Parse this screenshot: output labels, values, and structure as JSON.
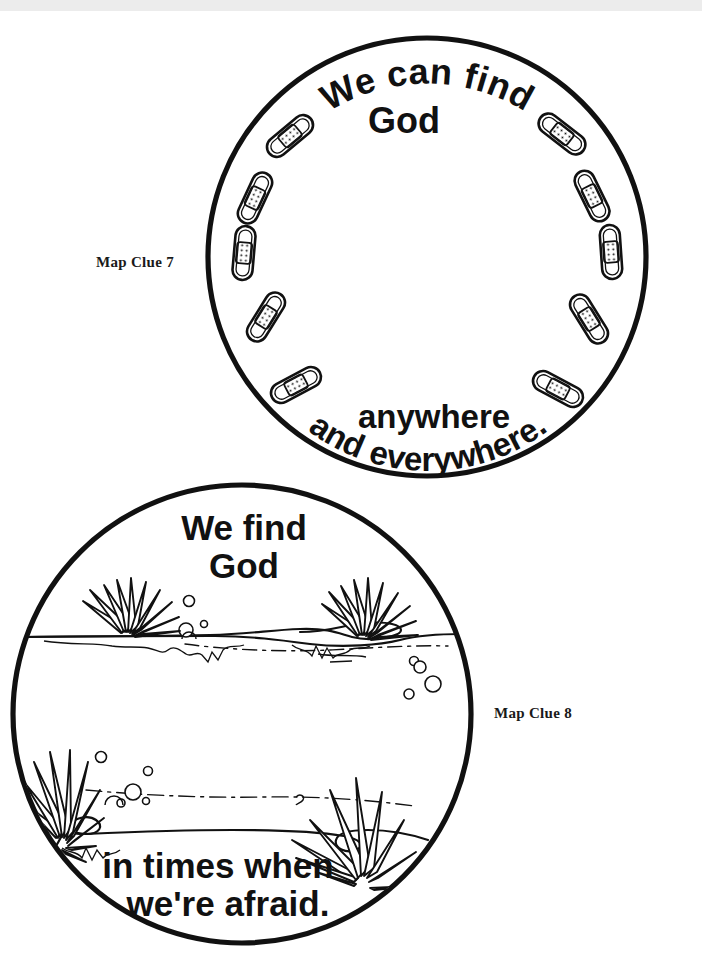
{
  "page": {
    "background_color": "#ffffff",
    "ink_color": "#111111",
    "width": 702,
    "height": 975
  },
  "labels": {
    "clue7": "Map Clue 7",
    "clue8": "Map Clue 8"
  },
  "circles": [
    {
      "id": "map-clue-7",
      "label": "Map Clue 7",
      "center_x": 427,
      "center_y": 257,
      "radius": 219,
      "stroke_width": 5,
      "theme": "bandages",
      "decoration_count": 10,
      "text": {
        "top_curved": "We can find",
        "top_second": "God",
        "bottom_straight": "anywhere",
        "bottom_curved": "and everywhere."
      }
    },
    {
      "id": "map-clue-8",
      "label": "Map Clue 8",
      "center_x": 242,
      "center_y": 714,
      "radius": 229,
      "stroke_width": 5,
      "theme": "pond-water-scene",
      "text": {
        "top_line1": "We find",
        "top_line2": "God",
        "bottom_line1": "in times when",
        "bottom_line2": "we're afraid."
      }
    }
  ],
  "bandages": [
    {
      "index": 1,
      "angle_deg": -126,
      "rotation_deg": -36
    },
    {
      "index": 2,
      "angle_deg": -162,
      "rotation_deg": -72
    },
    {
      "index": 3,
      "angle_deg": 162,
      "rotation_deg": -108
    },
    {
      "index": 4,
      "angle_deg": 126,
      "rotation_deg": -144
    },
    {
      "index": 5,
      "angle_deg": 100,
      "rotation_deg": -162
    },
    {
      "index": 6,
      "angle_deg": 80,
      "rotation_deg": 162
    },
    {
      "index": 7,
      "angle_deg": 54,
      "rotation_deg": 144
    },
    {
      "index": 8,
      "angle_deg": 18,
      "rotation_deg": 108
    },
    {
      "index": 9,
      "angle_deg": -18,
      "rotation_deg": 72
    },
    {
      "index": 10,
      "angle_deg": -54,
      "rotation_deg": 36
    }
  ],
  "pond_scene": {
    "water_lines": 2,
    "grass_tufts": 4,
    "bubbles": 12,
    "description": "Pond with two water surfaces, grass clumps at shore edges and rising bubbles"
  }
}
